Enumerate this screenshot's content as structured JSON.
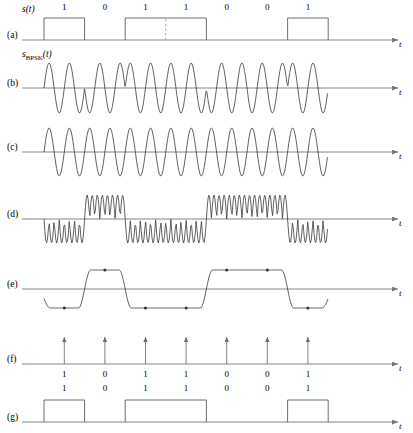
{
  "figure": {
    "width": 413,
    "height": 433,
    "axis_color": "#777777",
    "wave_color": "#3a3a3a",
    "pulse_color": "#555555",
    "dashed_color": "#999999",
    "t_axis_label": "t",
    "bit_sequence": [
      1,
      0,
      1,
      1,
      0,
      0,
      1
    ],
    "bit_labels": [
      "1",
      "0",
      "1",
      "1",
      "0",
      "0",
      "1"
    ],
    "bit_start_x": 44,
    "bit_width": 40.6,
    "axis_left_x": 22,
    "axis_right_x": 398
  },
  "rows": [
    {
      "id": "a",
      "row_label": "(a)",
      "signal_label": "s(t)",
      "signal_label_sub": "",
      "kind": "nrz-pulse",
      "baseline_y": 40,
      "amplitude": 22,
      "show_bit_labels": true,
      "bit_label_y": 10,
      "show_dashed_divider": true,
      "dashed_after_bit_index": 2,
      "t_label_x": 399,
      "t_label_y": 47
    },
    {
      "id": "b",
      "row_label": "(b)",
      "signal_label": "s",
      "signal_label_sub": "BPSK",
      "signal_label_tail": "(t)",
      "kind": "bpsk-carrier",
      "baseline_y": 88,
      "amplitude": 25,
      "cycles_per_bit": 2,
      "show_bit_labels": false,
      "t_label_x": 399,
      "t_label_y": 95
    },
    {
      "id": "c",
      "row_label": "(c)",
      "signal_label": "",
      "kind": "carrier",
      "baseline_y": 152,
      "amplitude": 24,
      "cycles_per_bit": 2,
      "show_bit_labels": false,
      "t_label_x": 399,
      "t_label_y": 159
    },
    {
      "id": "d",
      "row_label": "(d)",
      "signal_label": "",
      "kind": "product",
      "baseline_y": 219,
      "amplitude": 24,
      "cycles_per_bit": 4,
      "show_bit_labels": false,
      "t_label_x": 399,
      "t_label_y": 226
    },
    {
      "id": "e",
      "row_label": "(e)",
      "signal_label": "",
      "kind": "filtered",
      "baseline_y": 289,
      "amplitude": 19,
      "show_bit_labels": false,
      "show_sample_dots": true,
      "t_label_x": 399,
      "t_label_y": 296
    },
    {
      "id": "f",
      "row_label": "(f)",
      "signal_label": "",
      "kind": "impulses",
      "baseline_y": 364,
      "amplitude": 27,
      "show_bit_labels": true,
      "bit_label_y": 377,
      "t_label_x": 399,
      "t_label_y": 371
    },
    {
      "id": "g",
      "row_label": "(g)",
      "signal_label": "",
      "kind": "nrz-pulse",
      "baseline_y": 422,
      "amplitude": 22,
      "show_bit_labels": true,
      "bit_label_y": 391,
      "t_label_x": 399,
      "t_label_y": 429
    }
  ]
}
